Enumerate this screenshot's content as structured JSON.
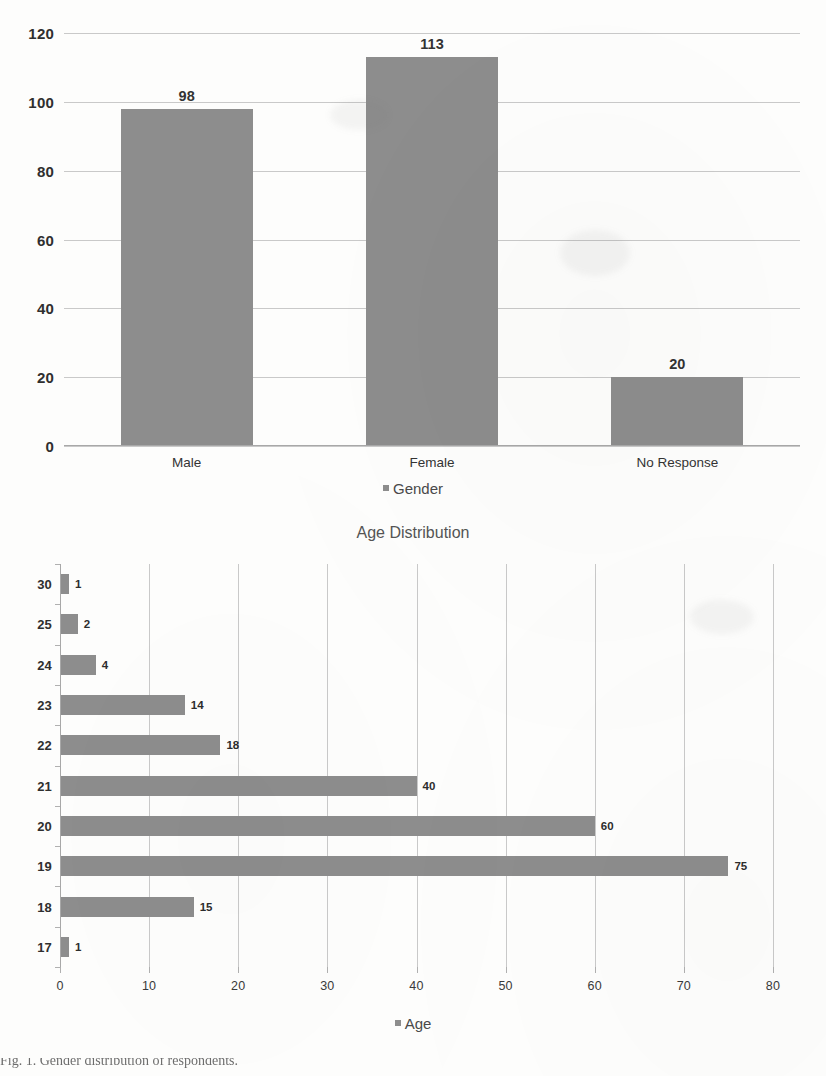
{
  "chart_data": [
    {
      "id": "gender",
      "type": "bar",
      "orientation": "vertical",
      "title": "",
      "categories": [
        "Male",
        "Female",
        "No Response"
      ],
      "values": [
        98,
        113,
        20
      ],
      "value_labels": [
        "98",
        "113",
        "20"
      ],
      "xlabel": "",
      "ylabel": "",
      "ylim": [
        0,
        120
      ],
      "y_ticks": [
        0,
        20,
        40,
        60,
        80,
        100,
        120
      ],
      "y_tick_labels": [
        "0",
        "20",
        "40",
        "60",
        "80",
        "100",
        "120"
      ],
      "grid": "horizontal",
      "legend": {
        "entries": [
          "Gender"
        ],
        "position": "bottom"
      },
      "series_color": "#8d8d8d"
    },
    {
      "id": "age",
      "type": "bar",
      "orientation": "horizontal",
      "title": "Age Distribution",
      "categories": [
        "30",
        "25",
        "24",
        "23",
        "22",
        "21",
        "20",
        "19",
        "18",
        "17"
      ],
      "values": [
        1,
        2,
        4,
        14,
        18,
        40,
        60,
        75,
        15,
        1
      ],
      "value_labels": [
        "1",
        "2",
        "4",
        "14",
        "18",
        "40",
        "60",
        "75",
        "15",
        "1"
      ],
      "xlabel": "",
      "ylabel": "",
      "xlim": [
        0,
        80
      ],
      "x_ticks": [
        0,
        10,
        20,
        30,
        40,
        50,
        60,
        70,
        80
      ],
      "x_tick_labels": [
        "0",
        "10",
        "20",
        "30",
        "40",
        "50",
        "60",
        "70",
        "80"
      ],
      "grid": "vertical",
      "legend": {
        "entries": [
          "Age"
        ],
        "position": "bottom"
      },
      "series_color": "#8d8d8d"
    }
  ],
  "gender": {
    "legend_label": "Gender",
    "y_tick_labels": [
      "120",
      "100",
      "80",
      "60",
      "40",
      "20",
      "0"
    ],
    "categories": [
      {
        "label": "Male",
        "value": 98,
        "value_label": "98"
      },
      {
        "label": "Female",
        "value": 113,
        "value_label": "113"
      },
      {
        "label": "No Response",
        "value": 20,
        "value_label": "20"
      }
    ]
  },
  "age": {
    "title": "Age Distribution",
    "legend_label": "Age",
    "x_tick_labels": [
      "0",
      "10",
      "20",
      "30",
      "40",
      "50",
      "60",
      "70",
      "80"
    ],
    "rows": [
      {
        "label": "30",
        "value": 1,
        "value_label": "1"
      },
      {
        "label": "25",
        "value": 2,
        "value_label": "2"
      },
      {
        "label": "24",
        "value": 4,
        "value_label": "4"
      },
      {
        "label": "23",
        "value": 14,
        "value_label": "14"
      },
      {
        "label": "22",
        "value": 18,
        "value_label": "18"
      },
      {
        "label": "21",
        "value": 40,
        "value_label": "40"
      },
      {
        "label": "20",
        "value": 60,
        "value_label": "60"
      },
      {
        "label": "19",
        "value": 75,
        "value_label": "75"
      },
      {
        "label": "18",
        "value": 15,
        "value_label": "15"
      },
      {
        "label": "17",
        "value": 1,
        "value_label": "1"
      }
    ]
  },
  "caption": {
    "text": "Fig. 1. Gender distribution of respondents."
  },
  "colors": {
    "bar": "#8d8d8d",
    "gridline": "#c9c9c9",
    "axis": "#a8a8a8",
    "text": "#3b3b3b"
  }
}
